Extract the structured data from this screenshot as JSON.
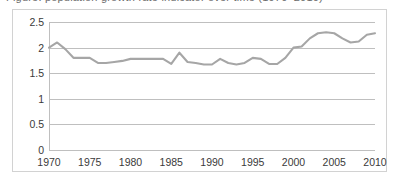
{
  "figure": {
    "title_clipped": "Figure: population growth rate indicator over time (1970–2010)"
  },
  "chart_data": {
    "type": "line",
    "title": "",
    "subtitle": "",
    "xlabel": "",
    "ylabel": "",
    "xlim": [
      1970,
      2010
    ],
    "ylim": [
      0,
      2.5
    ],
    "grid": true,
    "legend": "none",
    "series_color": "#a6a6a6",
    "y_ticks": [
      "0",
      "0.5",
      "1",
      "1.5",
      "2",
      "2.5"
    ],
    "y_tick_values": [
      0,
      0.5,
      1,
      1.5,
      2,
      2.5
    ],
    "x_ticks": [
      "1970",
      "1975",
      "1980",
      "1985",
      "1990",
      "1995",
      "2000",
      "2005",
      "2010"
    ],
    "x_tick_values": [
      1970,
      1975,
      1980,
      1985,
      1990,
      1995,
      2000,
      2005,
      2010
    ],
    "x": [
      1970,
      1971,
      1972,
      1973,
      1974,
      1975,
      1976,
      1977,
      1978,
      1979,
      1980,
      1981,
      1982,
      1983,
      1984,
      1985,
      1986,
      1987,
      1988,
      1989,
      1990,
      1991,
      1992,
      1993,
      1994,
      1995,
      1996,
      1997,
      1998,
      1999,
      2000,
      2001,
      2002,
      2003,
      2004,
      2005,
      2006,
      2007,
      2008,
      2009,
      2010
    ],
    "series": [
      {
        "name": "value",
        "values": [
          2.0,
          2.1,
          1.97,
          1.8,
          1.8,
          1.8,
          1.7,
          1.7,
          1.72,
          1.74,
          1.78,
          1.78,
          1.78,
          1.78,
          1.78,
          1.68,
          1.9,
          1.72,
          1.7,
          1.67,
          1.67,
          1.78,
          1.7,
          1.67,
          1.7,
          1.8,
          1.78,
          1.68,
          1.68,
          1.8,
          2.0,
          2.02,
          2.18,
          2.28,
          2.3,
          2.28,
          2.18,
          2.1,
          2.12,
          2.25,
          2.28
        ]
      }
    ]
  },
  "series_points": {
    "values": [
      2.0,
      2.1,
      1.97,
      1.8,
      1.8,
      1.8,
      1.7,
      1.7,
      1.72,
      1.74,
      1.78,
      1.78,
      1.78,
      1.78,
      1.78,
      1.68,
      1.9,
      1.72,
      1.7,
      1.67,
      1.67,
      1.78,
      1.7,
      1.67,
      1.7,
      1.8,
      1.78,
      1.68,
      1.68,
      1.8,
      2.0,
      2.02,
      2.18,
      2.28,
      2.3,
      2.28,
      2.18,
      2.1,
      2.12,
      2.25,
      2.28
    ]
  }
}
